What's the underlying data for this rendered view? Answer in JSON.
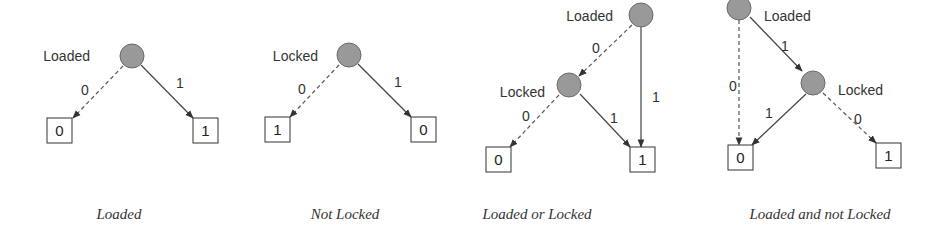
{
  "panels": [
    {
      "caption": "Loaded",
      "nodes": [
        {
          "label": "Loaded",
          "cx": 132,
          "cy": 56,
          "label_x": 90,
          "label_y": 61,
          "anchor": "end"
        }
      ],
      "terminals": [
        {
          "value": "0",
          "x": 47,
          "y": 118
        },
        {
          "value": "1",
          "x": 193,
          "y": 118
        }
      ],
      "edges": [
        {
          "from": "Loaded",
          "to": "0",
          "type": "dashed",
          "label": "0",
          "x1": 123,
          "y1": 66,
          "x2": 73,
          "y2": 118,
          "lx": 81,
          "ly": 95
        },
        {
          "from": "Loaded",
          "to": "1",
          "type": "solid",
          "label": "1",
          "x1": 141,
          "y1": 65,
          "x2": 193,
          "y2": 118,
          "lx": 176,
          "ly": 88
        }
      ],
      "caption_x": 119
    },
    {
      "caption": "Not Locked",
      "nodes": [
        {
          "label": "Locked",
          "cx": 349,
          "cy": 55,
          "label_x": 318,
          "label_y": 61,
          "anchor": "end"
        }
      ],
      "terminals": [
        {
          "value": "1",
          "x": 265,
          "y": 117
        },
        {
          "value": "0",
          "x": 411,
          "y": 117
        }
      ],
      "edges": [
        {
          "from": "Locked",
          "to": "1",
          "type": "dashed",
          "label": "0",
          "x1": 339,
          "y1": 65,
          "x2": 290,
          "y2": 117,
          "lx": 298,
          "ly": 94
        },
        {
          "from": "Locked",
          "to": "0",
          "type": "solid",
          "label": "1",
          "x1": 358,
          "y1": 64,
          "x2": 411,
          "y2": 117,
          "lx": 394,
          "ly": 87
        }
      ],
      "caption_x": 345
    },
    {
      "caption": "Loaded or Locked",
      "nodes": [
        {
          "label": "Loaded",
          "cx": 641,
          "cy": 15,
          "label_x": 613,
          "label_y": 21,
          "anchor": "end"
        },
        {
          "label": "Locked",
          "cx": 569,
          "cy": 85,
          "label_x": 545,
          "label_y": 97,
          "anchor": "end"
        }
      ],
      "terminals": [
        {
          "value": "0",
          "x": 486,
          "y": 147
        },
        {
          "value": "1",
          "x": 630,
          "y": 147
        }
      ],
      "edges": [
        {
          "from": "Loaded",
          "to": "Locked",
          "type": "dashed",
          "label": "0",
          "x1": 632,
          "y1": 25,
          "x2": 579,
          "y2": 76,
          "lx": 592,
          "ly": 53
        },
        {
          "from": "Loaded",
          "to": "1",
          "type": "solid",
          "label": "1",
          "x1": 641,
          "y1": 27,
          "x2": 641,
          "y2": 147,
          "lx": 652,
          "ly": 102
        },
        {
          "from": "Locked",
          "to": "0",
          "type": "dashed",
          "label": "0",
          "x1": 559,
          "y1": 95,
          "x2": 510,
          "y2": 147,
          "lx": 522,
          "ly": 121
        },
        {
          "from": "Locked",
          "to": "1",
          "type": "solid",
          "label": "1",
          "x1": 580,
          "y1": 94,
          "x2": 630,
          "y2": 147,
          "lx": 610,
          "ly": 123
        }
      ],
      "caption_x": 537
    },
    {
      "caption": "Loaded and not Locked",
      "nodes": [
        {
          "label": "Loaded",
          "cx": 739,
          "cy": 8,
          "label_x": 764,
          "label_y": 21,
          "anchor": "start"
        },
        {
          "label": "Locked",
          "cx": 813,
          "cy": 83,
          "label_x": 838,
          "label_y": 95,
          "anchor": "start"
        }
      ],
      "terminals": [
        {
          "value": "0",
          "x": 728,
          "y": 145
        },
        {
          "value": "1",
          "x": 876,
          "y": 143
        }
      ],
      "edges": [
        {
          "from": "Loaded",
          "to": "0",
          "type": "dashed",
          "label": "0",
          "x1": 739,
          "y1": 20,
          "x2": 739,
          "y2": 145,
          "lx": 729,
          "ly": 91
        },
        {
          "from": "Loaded",
          "to": "Locked",
          "type": "solid",
          "label": "1",
          "x1": 750,
          "y1": 17,
          "x2": 802,
          "y2": 71,
          "lx": 781,
          "ly": 51
        },
        {
          "from": "Locked",
          "to": "0",
          "type": "solid",
          "label": "1",
          "x1": 806,
          "y1": 94,
          "x2": 752,
          "y2": 145,
          "lx": 765,
          "ly": 118
        },
        {
          "from": "Locked",
          "to": "1",
          "type": "dashed",
          "label": "0",
          "x1": 823,
          "y1": 93,
          "x2": 876,
          "y2": 143,
          "lx": 854,
          "ly": 124
        }
      ],
      "caption_x": 820
    }
  ],
  "captions": [
    "Loaded",
    "Not Locked",
    "Loaded or Locked",
    "Loaded and not Locked"
  ],
  "colors": {
    "node_fill": "#999999",
    "node_stroke": "#6a6a6a",
    "edge": "#444444",
    "text": "#333333"
  }
}
